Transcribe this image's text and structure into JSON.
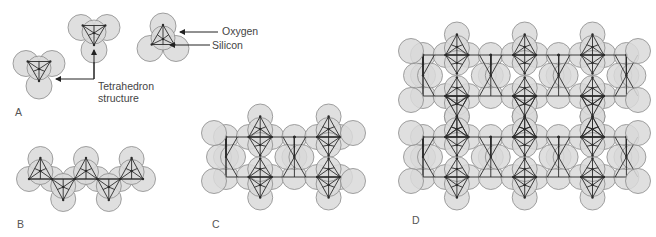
{
  "figure": {
    "colors": {
      "oxygen_fill": "#d9d9d9",
      "oxygen_stroke": "#8a8a8a",
      "bond_stroke": "#2b2b2b",
      "arrow": "#222222",
      "text": "#444444",
      "background": "#ffffff"
    }
  },
  "panels": [
    {
      "id": "A",
      "label": "A",
      "description": "Isolated SiO4 tetrahedra",
      "label_pos": [
        15,
        117
      ]
    },
    {
      "id": "B",
      "label": "B",
      "description": "Single-chain silicate",
      "label_pos": [
        17,
        229
      ]
    },
    {
      "id": "C",
      "label": "C",
      "description": "Double-chain silicate",
      "label_pos": [
        212,
        229
      ]
    },
    {
      "id": "D",
      "label": "D",
      "description": "Sheet silicate",
      "label_pos": [
        412,
        226
      ]
    }
  ],
  "annotations": {
    "oxygen": "Oxygen",
    "silicon": "Silicon",
    "tetrahedron_line1": "Tetrahedron",
    "tetrahedron_line2": "structure"
  }
}
